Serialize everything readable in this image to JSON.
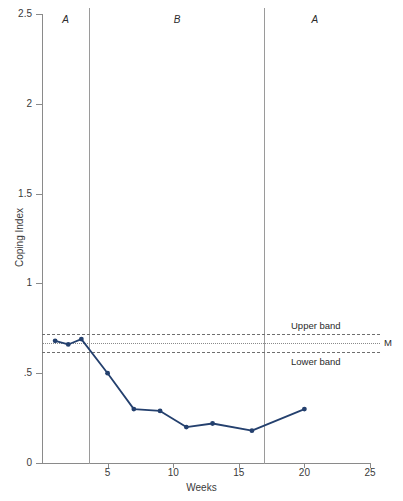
{
  "chart_data": {
    "type": "line",
    "title": "",
    "xlabel": "Weeks",
    "ylabel": "Coping Index",
    "xlim": [
      0,
      25
    ],
    "ylim": [
      0,
      2.5
    ],
    "grid": false,
    "legend_position": "none",
    "x_ticks": [
      "5",
      "10",
      "15",
      "20",
      "25"
    ],
    "x_tick_values": [
      5,
      10,
      15,
      20,
      25
    ],
    "y_ticks": [
      "0",
      ".5",
      "1",
      "1.5",
      "2",
      "2.5"
    ],
    "y_tick_values": [
      0,
      0.5,
      1,
      1.5,
      2,
      2.5
    ],
    "series": [
      {
        "name": "Coping Index",
        "color": "#24406e",
        "marker": "circle",
        "x": [
          1,
          2,
          3,
          5,
          7,
          9,
          11,
          13,
          16,
          20
        ],
        "values": [
          0.68,
          0.66,
          0.69,
          0.5,
          0.3,
          0.29,
          0.2,
          0.22,
          0.18,
          0.3
        ]
      }
    ],
    "reference_lines": [
      {
        "label": "Upper band",
        "value": 0.72,
        "style": "dashed",
        "color": "#6e6e6e"
      },
      {
        "label": "M",
        "value": 0.67,
        "style": "dotted",
        "color": "#8a8a8a"
      },
      {
        "label": "Lower band",
        "value": 0.62,
        "style": "dashed",
        "color": "#6e6e6e"
      }
    ],
    "phases": [
      {
        "label": "A",
        "center_week": 1.8,
        "boundary_week": 3.6
      },
      {
        "label": "B",
        "center_week": 10.3,
        "boundary_week": 16.9
      },
      {
        "label": "A",
        "center_week": 20.8,
        "boundary_week": null
      }
    ]
  },
  "annotations": {
    "upper_band_label": "Upper band",
    "lower_band_label": "Lower band",
    "mean_label": "M"
  }
}
